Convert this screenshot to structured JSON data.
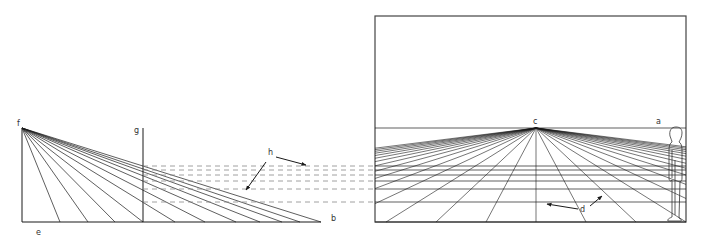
{
  "figure": {
    "colors": {
      "line": "#1a1a1a",
      "dash": "#888888",
      "frame": "#444444",
      "background": "#ffffff"
    }
  },
  "labels": {
    "a": "a",
    "b": "b",
    "c": "c",
    "d": "d",
    "e": "e",
    "f": "f",
    "g": "g",
    "h": "h"
  },
  "left_panel": {
    "eye_point_f": [
      22,
      128
    ],
    "base_left": [
      22,
      222
    ],
    "base_right_b": [
      321,
      222
    ],
    "picture_plane_g_x": 143,
    "ray_endpoints_x": [
      60,
      88,
      115,
      143,
      175,
      205,
      236,
      260,
      282,
      300,
      321
    ]
  },
  "projection_lines_y": [
    166,
    170,
    175,
    181,
    189,
    202
  ],
  "right_panel": {
    "frame": {
      "x": 375,
      "y": 16,
      "w": 311,
      "h": 206
    },
    "horizon_y": 128,
    "vanishing_point_c": [
      536,
      128
    ],
    "ground_lines_y": [
      166,
      170,
      175,
      181,
      189,
      202,
      222
    ],
    "converging_line_count": 31
  }
}
